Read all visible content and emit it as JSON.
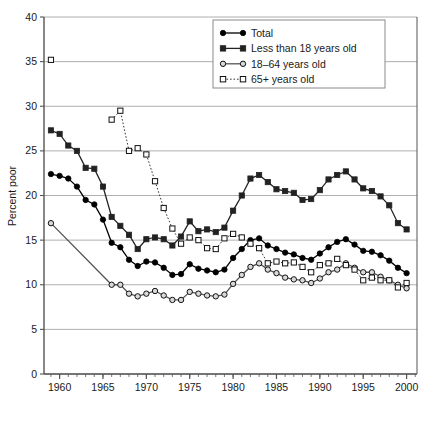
{
  "chart_data": {
    "type": "line",
    "title": "",
    "xlabel": "",
    "ylabel": "Percent poor",
    "xlim": [
      1958.2,
      2001.2
    ],
    "ylim": [
      0,
      40
    ],
    "ytick_step": 5,
    "xtick_step": 5,
    "x_minor_tick_step": 1,
    "grid": "horizontal",
    "legend_position": "top-right",
    "ytick_labels": [
      "0",
      "5",
      "10",
      "15",
      "20",
      "25",
      "30",
      "35",
      "40"
    ],
    "xtick_labels": [
      "1960",
      "1965",
      "1970",
      "1975",
      "1980",
      "1985",
      "1990",
      "1995",
      "2000"
    ],
    "series": [
      {
        "name": "Total",
        "marker": "filled-circle",
        "line": "solid",
        "color": "#000000",
        "x": [
          1959,
          1960,
          1961,
          1962,
          1963,
          1964,
          1965,
          1966,
          1967,
          1968,
          1969,
          1970,
          1971,
          1972,
          1973,
          1974,
          1975,
          1976,
          1977,
          1978,
          1979,
          1980,
          1981,
          1982,
          1983,
          1984,
          1985,
          1986,
          1987,
          1988,
          1989,
          1990,
          1991,
          1992,
          1993,
          1994,
          1995,
          1996,
          1997,
          1998,
          1999,
          2000
        ],
        "values": [
          22.4,
          22.2,
          21.9,
          21.0,
          19.5,
          19.0,
          17.3,
          14.7,
          14.2,
          12.8,
          12.1,
          12.6,
          12.5,
          11.9,
          11.1,
          11.2,
          12.3,
          11.8,
          11.6,
          11.4,
          11.7,
          13.0,
          14.0,
          15.0,
          15.2,
          14.4,
          14.0,
          13.6,
          13.4,
          13.0,
          12.8,
          13.5,
          14.2,
          14.8,
          15.1,
          14.5,
          13.8,
          13.7,
          13.3,
          12.7,
          11.9,
          11.3
        ]
      },
      {
        "name": "Less than 18 years old",
        "marker": "filled-square",
        "line": "solid",
        "color": "#222222",
        "x": [
          1959,
          1960,
          1961,
          1962,
          1963,
          1964,
          1965,
          1966,
          1967,
          1968,
          1969,
          1970,
          1971,
          1972,
          1973,
          1974,
          1975,
          1976,
          1977,
          1978,
          1979,
          1980,
          1981,
          1982,
          1983,
          1984,
          1985,
          1986,
          1987,
          1988,
          1989,
          1990,
          1991,
          1992,
          1993,
          1994,
          1995,
          1996,
          1997,
          1998,
          1999,
          2000
        ],
        "values": [
          27.3,
          26.9,
          25.6,
          25.0,
          23.1,
          23.0,
          21.0,
          17.6,
          16.6,
          15.6,
          14.0,
          15.1,
          15.3,
          15.1,
          14.4,
          15.4,
          17.1,
          16.0,
          16.2,
          15.9,
          16.4,
          18.3,
          20.0,
          21.9,
          22.3,
          21.5,
          20.7,
          20.5,
          20.3,
          19.5,
          19.6,
          20.6,
          21.8,
          22.3,
          22.7,
          21.8,
          20.8,
          20.5,
          19.9,
          18.9,
          16.9,
          16.2
        ]
      },
      {
        "name": "18–64 years old",
        "marker": "open-circle",
        "line": "solid",
        "color": "#555555",
        "x": [
          1959,
          1966,
          1967,
          1968,
          1969,
          1970,
          1971,
          1972,
          1973,
          1974,
          1975,
          1976,
          1977,
          1978,
          1979,
          1980,
          1981,
          1982,
          1983,
          1984,
          1985,
          1986,
          1987,
          1988,
          1989,
          1990,
          1991,
          1992,
          1993,
          1994,
          1995,
          1996,
          1997,
          1998,
          1999,
          2000
        ],
        "values": [
          16.9,
          10.0,
          10.0,
          9.0,
          8.7,
          9.0,
          9.3,
          8.8,
          8.3,
          8.3,
          9.2,
          9.0,
          8.8,
          8.7,
          8.9,
          10.1,
          11.1,
          12.0,
          12.4,
          11.7,
          11.3,
          10.8,
          10.6,
          10.5,
          10.2,
          10.7,
          11.4,
          11.7,
          12.4,
          11.9,
          11.4,
          11.4,
          10.9,
          10.5,
          10.0,
          9.6
        ]
      },
      {
        "name": "65+ years old",
        "marker": "open-square",
        "line": "dotted",
        "color": "#333333",
        "segments": [
          {
            "x": [
              1959
            ],
            "values": [
              35.2
            ]
          },
          {
            "x": [
              1966,
              1967,
              1968,
              1969,
              1970,
              1971,
              1972,
              1973,
              1974,
              1975,
              1976,
              1977,
              1978,
              1979,
              1980,
              1981,
              1982,
              1983,
              1984,
              1985,
              1986,
              1987,
              1988,
              1989,
              1990,
              1991,
              1992,
              1993,
              1994,
              1995,
              1996,
              1997,
              1998,
              1999,
              2000
            ],
            "values": [
              28.5,
              29.5,
              25.0,
              25.3,
              24.6,
              21.6,
              18.6,
              16.3,
              14.6,
              15.3,
              15.0,
              14.1,
              14.0,
              15.2,
              15.7,
              15.3,
              14.6,
              14.1,
              12.4,
              12.6,
              12.4,
              12.5,
              12.0,
              11.4,
              12.2,
              12.4,
              12.9,
              12.2,
              11.7,
              10.5,
              10.8,
              10.5,
              10.5,
              9.7,
              10.2
            ]
          }
        ]
      }
    ]
  },
  "legend": {
    "entries": [
      {
        "label": "Total",
        "marker": "filled-circle",
        "line": "solid"
      },
      {
        "label": "Less than 18 years old",
        "marker": "filled-square",
        "line": "solid"
      },
      {
        "label": "18–64 years old",
        "marker": "open-circle",
        "line": "solid"
      },
      {
        "label": "65+ years old",
        "marker": "open-square",
        "line": "dotted"
      }
    ]
  },
  "colors": {
    "background": "#ffffff",
    "grid": "#9a9a9a",
    "axis": "#555555",
    "text": "#1a1a1a",
    "legend_border": "#8a8a8a"
  }
}
